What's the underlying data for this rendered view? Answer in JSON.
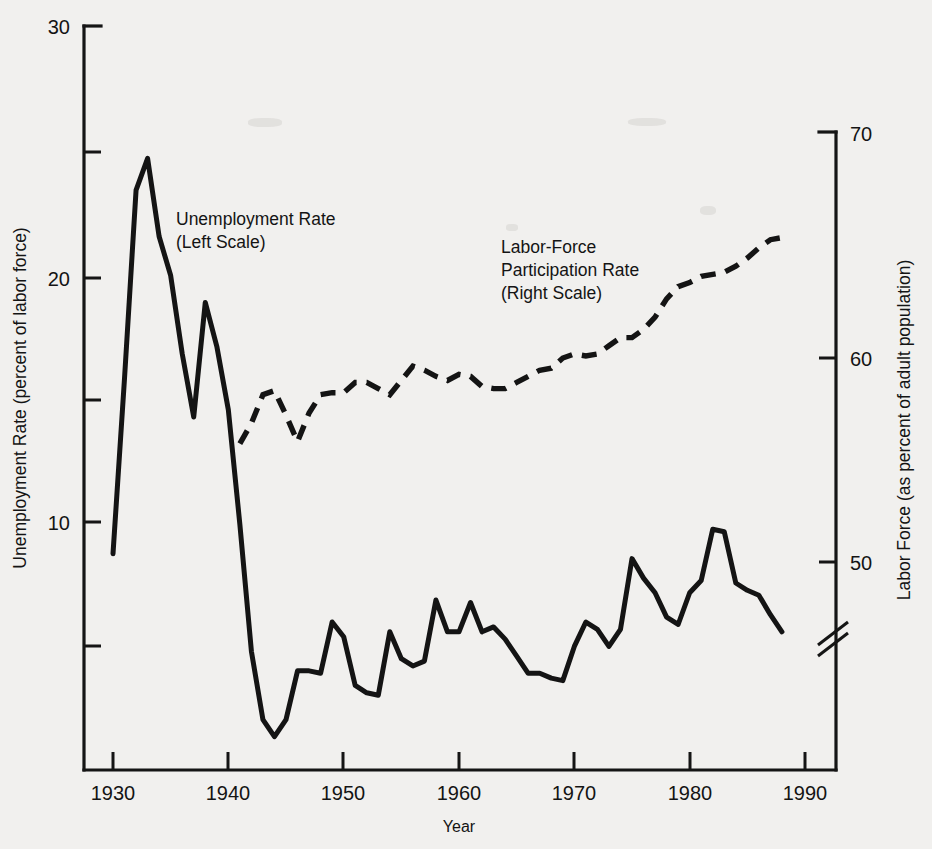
{
  "chart_data": {
    "type": "line",
    "title": "",
    "xlabel": "Year",
    "grid": false,
    "legend_position": "inline-annotations",
    "x_axis": {
      "label": "Year",
      "ticks": [
        1930,
        1940,
        1950,
        1960,
        1970,
        1980,
        1990
      ],
      "tick_labels": [
        "1930",
        "1940",
        "1950",
        "1960",
        "1970",
        "1980",
        "1990"
      ],
      "range": [
        1928,
        1992
      ]
    },
    "y_axis_left": {
      "label": "Unemployment Rate (percent of labor force)",
      "ticks": [
        10,
        20,
        30
      ],
      "tick_labels": [
        "10",
        "20",
        "30"
      ],
      "minor_ticks": [
        5,
        15,
        25
      ],
      "range": [
        0,
        30
      ]
    },
    "y_axis_right": {
      "label": "Labor Force (as percent of adult population)",
      "ticks": [
        50,
        60,
        70
      ],
      "tick_labels": [
        "50",
        "60",
        "70"
      ],
      "range": [
        47,
        70
      ],
      "axis_break": true,
      "axis_break_note": "//"
    },
    "annotations": [
      {
        "name": "unemployment-annotation",
        "lines": [
          "Unemployment Rate",
          "(Left Scale)"
        ],
        "x": 1933.6,
        "y_left": 22.6
      },
      {
        "name": "participation-annotation",
        "lines": [
          "Labor-Force",
          "Participation Rate",
          "(Right Scale)"
        ],
        "x": 1955.5,
        "y_left": 21.8
      }
    ],
    "series": [
      {
        "name": "Unemployment Rate",
        "axis": "left",
        "style": "solid",
        "unit": "percent of labor force",
        "x": [
          1930,
          1931,
          1932,
          1933,
          1934,
          1935,
          1936,
          1937,
          1938,
          1939,
          1940,
          1941,
          1942,
          1943,
          1944,
          1945,
          1946,
          1947,
          1948,
          1949,
          1950,
          1951,
          1952,
          1953,
          1954,
          1955,
          1956,
          1957,
          1958,
          1959,
          1960,
          1961,
          1962,
          1963,
          1964,
          1965,
          1966,
          1967,
          1968,
          1969,
          1970,
          1971,
          1972,
          1973,
          1974,
          1975,
          1976,
          1977,
          1978,
          1979,
          1980,
          1981,
          1982,
          1983,
          1984,
          1985,
          1986,
          1987,
          1988
        ],
        "values": [
          8.7,
          15.9,
          23.6,
          24.9,
          21.7,
          20.1,
          16.9,
          14.3,
          19.0,
          17.2,
          14.6,
          9.9,
          4.7,
          1.9,
          1.2,
          1.9,
          3.9,
          3.9,
          3.8,
          5.9,
          5.3,
          3.3,
          3.0,
          2.9,
          5.5,
          4.4,
          4.1,
          4.3,
          6.8,
          5.5,
          5.5,
          6.7,
          5.5,
          5.7,
          5.2,
          4.5,
          3.8,
          3.8,
          3.6,
          3.5,
          4.9,
          5.9,
          5.6,
          4.9,
          5.6,
          8.5,
          7.7,
          7.1,
          6.1,
          5.8,
          7.1,
          7.6,
          9.7,
          9.6,
          7.5,
          7.2,
          7.0,
          6.2,
          5.5
        ]
      },
      {
        "name": "Labor-Force Participation Rate",
        "axis": "right",
        "style": "dashed",
        "unit": "percent of adult population",
        "x": [
          1941,
          1942,
          1943,
          1944,
          1945,
          1946,
          1947,
          1948,
          1949,
          1950,
          1951,
          1952,
          1953,
          1954,
          1955,
          1956,
          1957,
          1958,
          1959,
          1960,
          1961,
          1962,
          1963,
          1964,
          1965,
          1966,
          1967,
          1968,
          1969,
          1970,
          1971,
          1972,
          1973,
          1974,
          1975,
          1976,
          1977,
          1978,
          1979,
          1980,
          1981,
          1982,
          1983,
          1984,
          1985,
          1986,
          1987,
          1988
        ],
        "values": [
          55.8,
          56.8,
          58.2,
          58.4,
          57.2,
          55.9,
          57.3,
          58.2,
          58.3,
          58.3,
          58.8,
          58.8,
          58.5,
          58.2,
          58.9,
          59.6,
          59.4,
          59.1,
          58.9,
          59.2,
          59.1,
          58.6,
          58.5,
          58.5,
          58.8,
          59.1,
          59.4,
          59.5,
          60.0,
          60.2,
          60.1,
          60.2,
          60.6,
          61.0,
          61.0,
          61.4,
          62.0,
          62.9,
          63.5,
          63.7,
          64.0,
          64.1,
          64.2,
          64.5,
          64.9,
          65.4,
          65.8,
          65.9
        ]
      }
    ]
  },
  "labels": {
    "x_ticks": [
      "1930",
      "1940",
      "1950",
      "1960",
      "1970",
      "1980",
      "1990"
    ],
    "y_left_ticks": [
      "10",
      "20",
      "30"
    ],
    "y_right_ticks": [
      "50",
      "60",
      "70"
    ],
    "x_axis_title": "Year",
    "y_left_title": "Unemployment Rate (percent of labor force)",
    "y_right_title": "Labor Force (as percent of adult population)",
    "annot_unemployment_line1": "Unemployment Rate",
    "annot_unemployment_line2": "(Left Scale)",
    "annot_participation_line1": "Labor-Force",
    "annot_participation_line2": "Participation Rate",
    "annot_participation_line3": "(Right Scale)"
  },
  "colors": {
    "background": "#f1f0ee",
    "ink": "#141414"
  }
}
